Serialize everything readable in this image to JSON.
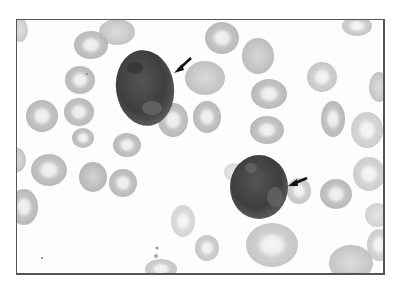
{
  "image": {
    "description": "Grayscale blood smear micrograph showing two large dark-staining cells among red blood cells, each indicated by a black arrow",
    "colors": {
      "background": "#fdfdfd",
      "rbc": "#bdbdbd",
      "rbc_center": "#ececec",
      "dark_cell": "#4a4a4a",
      "arrow": "#111111",
      "frame_border": "#555555"
    },
    "annotations": [
      {
        "type": "arrow",
        "target": "upper-left dark cell"
      },
      {
        "type": "arrow",
        "target": "lower-right dark cell"
      }
    ]
  }
}
